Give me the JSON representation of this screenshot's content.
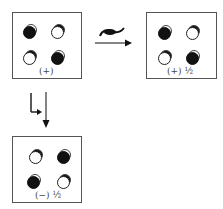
{
  "panels": [
    {
      "id": "original",
      "label": "(+)",
      "dots": [
        {
          "pos": "top-left",
          "state": "filled"
        },
        {
          "pos": "top-right",
          "state": "open"
        },
        {
          "pos": "bottom-left",
          "state": "open"
        },
        {
          "pos": "bottom-right",
          "state": "filled"
        }
      ]
    },
    {
      "id": "rotated",
      "label": "(+) ½",
      "dots": [
        {
          "pos": "top-left",
          "state": "filled"
        },
        {
          "pos": "top-right",
          "state": "open"
        },
        {
          "pos": "bottom-left",
          "state": "open"
        },
        {
          "pos": "bottom-right",
          "state": "filled"
        }
      ]
    },
    {
      "id": "reflected",
      "label": "(−) ½",
      "dots": [
        {
          "pos": "top-left",
          "state": "open"
        },
        {
          "pos": "top-right",
          "state": "filled"
        },
        {
          "pos": "bottom-left",
          "state": "filled"
        },
        {
          "pos": "bottom-right",
          "state": "open"
        }
      ]
    }
  ],
  "arrows": [
    {
      "id": "rotation",
      "direction": "right",
      "symbol": "rotation-glyph"
    },
    {
      "id": "reflection",
      "direction": "down",
      "symbol": "reflection-glyph"
    }
  ]
}
